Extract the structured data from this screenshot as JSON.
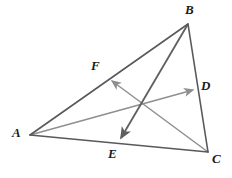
{
  "figure": {
    "type": "geometry-diagram",
    "width": 232,
    "height": 178,
    "background_color": "#ffffff"
  },
  "colors": {
    "triangle_stroke": "#595959",
    "cevian_light_stroke": "#8f8f8f",
    "cevian_dark_stroke": "#5f5f5f",
    "label_color": "#1a1a1a",
    "background": "#ffffff"
  },
  "geometry": {
    "vertices": [
      {
        "id": "A",
        "label": "A",
        "x": 30,
        "y": 135,
        "label_x": 12,
        "label_y": 127
      },
      {
        "id": "B",
        "label": "B",
        "x": 188,
        "y": 24,
        "label_x": 186,
        "label_y": 4
      },
      {
        "id": "C",
        "label": "C",
        "x": 208,
        "y": 152,
        "label_x": 212,
        "label_y": 152
      }
    ],
    "points_on_sides": [
      {
        "id": "F",
        "label": "F",
        "on_side": "AB",
        "x": 108,
        "y": 78,
        "label_x": 91,
        "label_y": 60
      },
      {
        "id": "D",
        "label": "D",
        "on_side": "BC",
        "x": 197,
        "y": 89,
        "label_x": 201,
        "label_y": 80
      },
      {
        "id": "E",
        "label": "E",
        "on_side": "AC",
        "x": 119,
        "y": 143,
        "label_x": 108,
        "label_y": 147
      }
    ],
    "sides": [
      {
        "id": "AB",
        "from": "A",
        "to": "B",
        "x1": 30,
        "y1": 135,
        "x2": 188,
        "y2": 24
      },
      {
        "id": "BC",
        "from": "B",
        "to": "C",
        "x1": 188,
        "y1": 24,
        "x2": 208,
        "y2": 152
      },
      {
        "id": "AC",
        "from": "A",
        "to": "C",
        "x1": 30,
        "y1": 135,
        "x2": 208,
        "y2": 152
      }
    ],
    "cevians": [
      {
        "id": "C-to-F",
        "from": "C",
        "to": "F",
        "x1": 208,
        "y1": 152,
        "x2": 110,
        "y2": 80,
        "style": "light",
        "arrow": "end"
      },
      {
        "id": "A-to-D",
        "from": "A",
        "to": "D",
        "x1": 30,
        "y1": 135,
        "x2": 195,
        "y2": 90,
        "style": "light",
        "arrow": "end"
      },
      {
        "id": "B-to-E",
        "from": "B",
        "to": "E",
        "x1": 188,
        "y1": 24,
        "x2": 120,
        "y2": 141,
        "style": "dark",
        "arrow": "end"
      }
    ],
    "intersection": {
      "id": "centroid",
      "x": 142,
      "y": 104
    }
  }
}
